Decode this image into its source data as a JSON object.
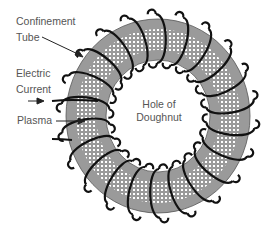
{
  "diagram": {
    "type": "toroidal-confinement-schematic",
    "labels": {
      "confinement_tube_line1": "Confinement",
      "confinement_tube_line2": "Tube",
      "electric_current_line1": "Electric",
      "electric_current_line2": "Current",
      "plasma": "Plasma",
      "hole_line1": "Hole of",
      "hole_line2": "Doughnut"
    },
    "colors": {
      "tube_fill": "#9a9a9a",
      "plasma_dots": "#ffffff",
      "coil_stroke": "#111111",
      "label_text": "#555555",
      "background": "#ffffff"
    },
    "torus": {
      "center": [
        158,
        116
      ],
      "outer_radius": [
        92,
        97
      ],
      "inner_radius": [
        52,
        56
      ],
      "coil_count": 22
    }
  }
}
